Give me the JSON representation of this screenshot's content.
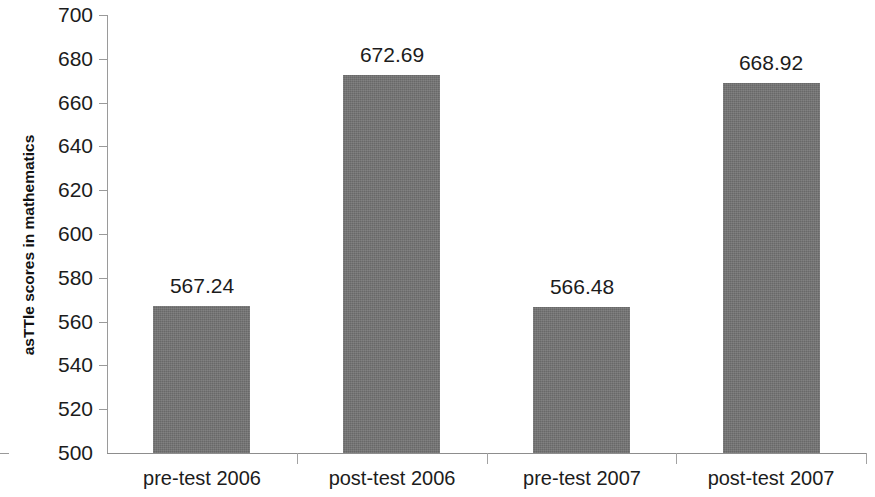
{
  "chart_data": {
    "type": "bar",
    "title": "",
    "xlabel": "",
    "ylabel": "asTTle scores in mathematics",
    "categories": [
      "pre-test 2006",
      "post-test 2006",
      "pre-test 2007",
      "post-test 2007"
    ],
    "values": [
      567.24,
      672.69,
      566.48,
      668.92
    ],
    "value_labels": [
      "567.24",
      "672.69",
      "566.48",
      "668.92"
    ],
    "ylim": [
      500,
      700
    ],
    "ytick_labels": [
      "700",
      "680",
      "660",
      "640",
      "620",
      "600",
      "580",
      "560",
      "540",
      "520",
      "500"
    ],
    "ytick_values": [
      700,
      680,
      660,
      640,
      620,
      600,
      580,
      560,
      540,
      520,
      500
    ],
    "grid": false,
    "legend": null,
    "bar_color": "#737373",
    "axis_color": "#8d8d8d",
    "text_color": "#1c1c1c",
    "background": "#ffffff"
  }
}
